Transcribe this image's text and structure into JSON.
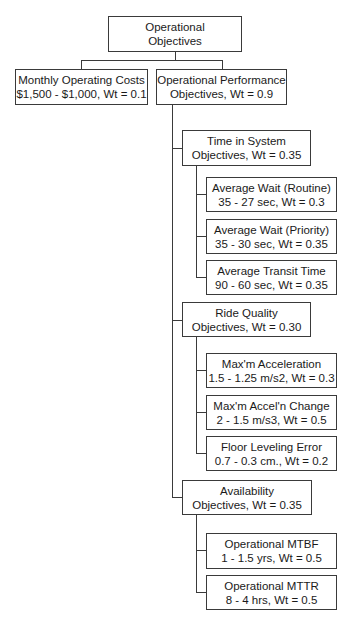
{
  "root": {
    "line1": "Operational",
    "line2": "Objectives"
  },
  "monthly_costs": {
    "line1": "Monthly Operating Costs",
    "line2": "$1,500 - $1,000, Wt = 0.1"
  },
  "operational_performance": {
    "line1": "Operational Performance",
    "line2": "Objectives, Wt = 0.9"
  },
  "time_in_system": {
    "line1": "Time in System",
    "line2": "Objectives, Wt = 0.35",
    "children": [
      {
        "line1": "Average Wait (Routine)",
        "line2": "35 - 27 sec, Wt = 0.3"
      },
      {
        "line1": "Average Wait (Priority)",
        "line2": "35 - 30 sec, Wt = 0.35"
      },
      {
        "line1": "Average Transit Time",
        "line2": "90 - 60 sec, Wt = 0.35"
      }
    ]
  },
  "ride_quality": {
    "line1": "Ride Quality",
    "line2": "Objectives, Wt = 0.30",
    "children": [
      {
        "line1": "Max'm Acceleration",
        "line2": "1.5 - 1.25 m/s2, Wt = 0.3"
      },
      {
        "line1": "Max'm Accel'n Change",
        "line2": "2 - 1.5 m/s3, Wt = 0.5"
      },
      {
        "line1": "Floor Leveling Error",
        "line2": "0.7 - 0.3 cm., Wt = 0.2"
      }
    ]
  },
  "availability": {
    "line1": "Availability",
    "line2": "Objectives, Wt = 0.35",
    "children": [
      {
        "line1": "Operational MTBF",
        "line2": "1 - 1.5 yrs, Wt = 0.5"
      },
      {
        "line1": "Operational MTTR",
        "line2": "8 - 4 hrs, Wt = 0.5"
      }
    ]
  }
}
